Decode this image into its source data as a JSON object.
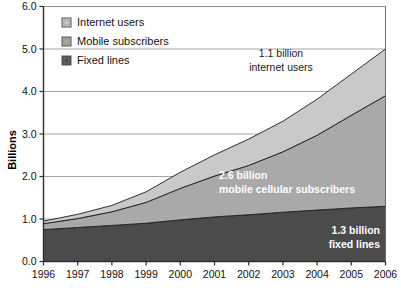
{
  "chart_data": {
    "type": "area",
    "stacked": true,
    "title": "",
    "subtitle": "",
    "xlabel": "",
    "ylabel": "Billions",
    "xlim": [
      1996,
      2006
    ],
    "ylim": [
      0.0,
      6.0
    ],
    "ytick_step": 1.0,
    "grid": true,
    "grid_axis": "y",
    "legend_position": "top-left",
    "categories": [
      "1996",
      "1997",
      "1998",
      "1999",
      "2000",
      "2001",
      "2002",
      "2003",
      "2004",
      "2005",
      "2006"
    ],
    "x": [
      1996,
      1997,
      1998,
      1999,
      2000,
      2001,
      2002,
      2003,
      2004,
      2005,
      2006
    ],
    "xtick_labels": [
      "1996",
      "1997",
      "1998",
      "1999",
      "2000",
      "2001",
      "2002",
      "2003",
      "2004",
      "2005",
      "2006"
    ],
    "ytick_labels": [
      "0.0",
      "1.0",
      "2.0",
      "3.0",
      "4.0",
      "5.0",
      "6.0"
    ],
    "series": [
      {
        "name": "Fixed lines",
        "color": "#4b4b4b",
        "values": [
          0.75,
          0.8,
          0.85,
          0.9,
          0.98,
          1.05,
          1.1,
          1.16,
          1.21,
          1.26,
          1.3
        ]
      },
      {
        "name": "Mobile subscribers",
        "color": "#a9a9a9",
        "values": [
          0.14,
          0.21,
          0.32,
          0.49,
          0.74,
          0.96,
          1.16,
          1.42,
          1.76,
          2.18,
          2.6
        ]
      },
      {
        "name": "Internet users",
        "color": "#c9c9c9",
        "values": [
          0.06,
          0.1,
          0.15,
          0.25,
          0.38,
          0.5,
          0.62,
          0.72,
          0.85,
          0.97,
          1.1
        ]
      }
    ],
    "annotations": [
      {
        "id": "internet-annotation",
        "lines": [
          "1.1 billion",
          "internet users"
        ],
        "style": "dark"
      },
      {
        "id": "mobile-annotation",
        "lines": [
          "2.6 billion",
          "mobile cellular subscribers"
        ],
        "style": "white"
      },
      {
        "id": "fixed-annotation",
        "lines": [
          "1.3 billion",
          "fixed lines"
        ],
        "style": "white"
      }
    ]
  },
  "legend": {
    "items": [
      {
        "label": "Internet users",
        "color": "#c9c9c9"
      },
      {
        "label": "Mobile subscribers",
        "color": "#a9a9a9"
      },
      {
        "label": "Fixed lines",
        "color": "#4b4b4b"
      }
    ]
  },
  "axes": {
    "y_title": "Billions",
    "y_ticks": [
      "6.0",
      "5.0",
      "4.0",
      "3.0",
      "2.0",
      "1.0",
      "0.0"
    ],
    "x_ticks": [
      "1996",
      "1997",
      "1998",
      "1999",
      "2000",
      "2001",
      "2002",
      "2003",
      "2004",
      "2005",
      "2006"
    ]
  },
  "annotations": {
    "internet_line1": "1.1 billion",
    "internet_line2": "internet users",
    "mobile_line1": "2.6 billion",
    "mobile_line2": "mobile cellular subscribers",
    "fixed_line1": "1.3 billion",
    "fixed_line2": "fixed lines"
  },
  "colors": {
    "internet": "#c9c9c9",
    "mobile": "#a9a9a9",
    "fixed": "#4b4b4b",
    "grid": "#9a9a9a",
    "axis": "#404040",
    "background": "#ffffff"
  }
}
